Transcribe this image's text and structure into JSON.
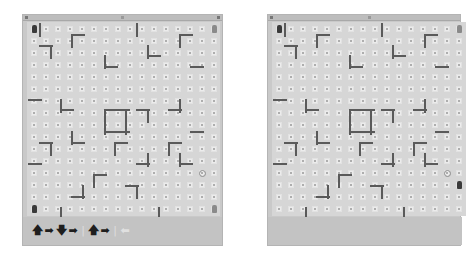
{
  "colors": {
    "window_bg": "#c9c9c9",
    "board_bg": "#d6d6d6",
    "wall": "#5a5a5a",
    "robot": "#3a3a3a"
  },
  "grid": {
    "cols": 16,
    "rows": 16,
    "cell_px": 12
  },
  "left_window": {
    "title": "",
    "move_sequence": [
      {
        "icon": "arrow-up-icon",
        "glyph": "🡅",
        "active": true
      },
      {
        "icon": "arrow-right-icon",
        "glyph": "➡",
        "active": true
      },
      {
        "icon": "arrow-down-icon",
        "glyph": "🡇",
        "active": true
      },
      {
        "icon": "arrow-right-icon",
        "glyph": "➡",
        "active": true
      },
      {
        "icon": "separator-icon",
        "glyph": "|",
        "active": false
      },
      {
        "icon": "arrow-up-icon",
        "glyph": "🡅",
        "active": true
      },
      {
        "icon": "arrow-right-icon",
        "glyph": "➡",
        "active": true
      },
      {
        "icon": "separator-icon",
        "glyph": "|",
        "active": false
      },
      {
        "icon": "arrow-left-icon",
        "glyph": "⬅",
        "active": false
      }
    ],
    "robots": [
      {
        "col": 0,
        "row": 0,
        "shade": "dark"
      },
      {
        "col": 15,
        "row": 0,
        "shade": "light"
      },
      {
        "col": 0,
        "row": 15,
        "shade": "dark"
      },
      {
        "col": 15,
        "row": 15,
        "shade": "light"
      }
    ],
    "target": {
      "col": 14,
      "row": 12
    }
  },
  "right_window": {
    "title": "",
    "robots": [
      {
        "col": 0,
        "row": 0,
        "shade": "dark"
      },
      {
        "col": 15,
        "row": 0,
        "shade": "light"
      },
      {
        "col": 15,
        "row": 13,
        "shade": "dark"
      }
    ],
    "target": {
      "col": 14,
      "row": 12
    }
  },
  "walls": [
    {
      "x": 1,
      "y": 0,
      "o": "v",
      "len": 1
    },
    {
      "x": 4,
      "y": 1,
      "o": "h",
      "len": 1
    },
    {
      "x": 4,
      "y": 1,
      "o": "v",
      "len": 1
    },
    {
      "x": 1,
      "y": 2,
      "o": "h",
      "len": 1
    },
    {
      "x": 2,
      "y": 2,
      "o": "v",
      "len": 1
    },
    {
      "x": 10,
      "y": 0,
      "o": "v",
      "len": 1
    },
    {
      "x": 14,
      "y": 1,
      "o": "h",
      "len": 1
    },
    {
      "x": 14,
      "y": 1,
      "o": "v",
      "len": 1
    },
    {
      "x": 11,
      "y": 3,
      "o": "h",
      "len": 1
    },
    {
      "x": 11,
      "y": 2,
      "o": "v",
      "len": 1
    },
    {
      "x": 7,
      "y": 4,
      "o": "h",
      "len": 1
    },
    {
      "x": 7,
      "y": 3,
      "o": "v",
      "len": 1
    },
    {
      "x": 15,
      "y": 4,
      "o": "h",
      "len": 1
    },
    {
      "x": 0,
      "y": 7,
      "o": "h",
      "len": 1
    },
    {
      "x": 3,
      "y": 8,
      "o": "h",
      "len": 1
    },
    {
      "x": 3,
      "y": 7,
      "o": "v",
      "len": 1
    },
    {
      "x": 7,
      "y": 8,
      "o": "h",
      "len": 2
    },
    {
      "x": 7,
      "y": 8,
      "o": "v",
      "len": 2
    },
    {
      "x": 9,
      "y": 8,
      "o": "v",
      "len": 2
    },
    {
      "x": 7,
      "y": 10,
      "o": "h",
      "len": 2
    },
    {
      "x": 10,
      "y": 8,
      "o": "h",
      "len": 1
    },
    {
      "x": 11,
      "y": 8,
      "o": "v",
      "len": 1
    },
    {
      "x": 13,
      "y": 8,
      "o": "h",
      "len": 1
    },
    {
      "x": 14,
      "y": 7,
      "o": "v",
      "len": 1
    },
    {
      "x": 15,
      "y": 10,
      "o": "h",
      "len": 1
    },
    {
      "x": 4,
      "y": 11,
      "o": "h",
      "len": 1
    },
    {
      "x": 4,
      "y": 10,
      "o": "v",
      "len": 1
    },
    {
      "x": 1,
      "y": 11,
      "o": "h",
      "len": 1
    },
    {
      "x": 2,
      "y": 11,
      "o": "v",
      "len": 1
    },
    {
      "x": 8,
      "y": 11,
      "o": "h",
      "len": 1
    },
    {
      "x": 8,
      "y": 11,
      "o": "v",
      "len": 1
    },
    {
      "x": 13,
      "y": 11,
      "o": "h",
      "len": 1
    },
    {
      "x": 13,
      "y": 11,
      "o": "v",
      "len": 1
    },
    {
      "x": 0,
      "y": 13,
      "o": "h",
      "len": 1
    },
    {
      "x": 10,
      "y": 13,
      "o": "h",
      "len": 1
    },
    {
      "x": 11,
      "y": 12,
      "o": "v",
      "len": 1
    },
    {
      "x": 14,
      "y": 13,
      "o": "h",
      "len": 1
    },
    {
      "x": 14,
      "y": 12,
      "o": "v",
      "len": 1
    },
    {
      "x": 6,
      "y": 14,
      "o": "h",
      "len": 1
    },
    {
      "x": 6,
      "y": 14,
      "o": "v",
      "len": 1
    },
    {
      "x": 9,
      "y": 15,
      "o": "h",
      "len": 1
    },
    {
      "x": 10,
      "y": 15,
      "o": "v",
      "len": 1
    },
    {
      "x": 4,
      "y": 16,
      "o": "h",
      "len": 1
    },
    {
      "x": 5,
      "y": 15,
      "o": "v",
      "len": 1
    },
    {
      "x": 3,
      "y": 17,
      "o": "v",
      "len": 1
    },
    {
      "x": 12,
      "y": 17,
      "o": "v",
      "len": 1
    }
  ]
}
